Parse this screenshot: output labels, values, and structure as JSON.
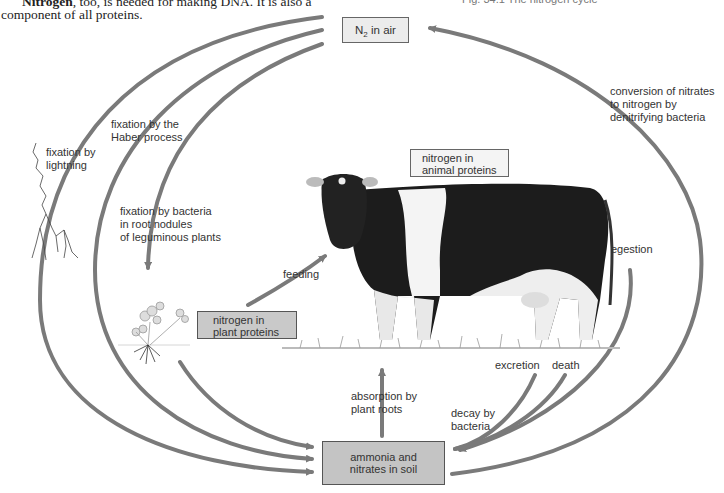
{
  "book": {
    "line1_bold": "Nitrogen",
    "line1_rest": ", too, is needed for making DNA. It is also a",
    "line2": "component of all proteins.",
    "figure_caption": "Fig. 34.1   The nitrogen cycle"
  },
  "diagram": {
    "title": "The nitrogen cycle",
    "boxes": {
      "air": {
        "main": "N",
        "sub": "2",
        "rest": " in air"
      },
      "animal": {
        "line1": "nitrogen in",
        "line2": "animal proteins"
      },
      "plant": {
        "line1": "nitrogen in",
        "line2": "plant proteins"
      },
      "soil": {
        "line1": "ammonia and",
        "line2": "nitrates in soil"
      }
    },
    "labels": {
      "lightning": {
        "line1": "fixation by",
        "line2": "lightning"
      },
      "haber": {
        "line1": "fixation by the",
        "line2": "Haber process"
      },
      "bacteria": {
        "line1": "fixation by bacteria",
        "line2": "in root nodules",
        "line3": "of leguminous plants"
      },
      "denitrify": {
        "line1": "conversion of nitrates",
        "line2": "to nitrogen by",
        "line3": "denitrifying bacteria"
      },
      "feeding": "feeding",
      "egestion": "egestion",
      "excretion": "excretion",
      "death": "death",
      "decay": {
        "line1": "decay by",
        "line2": "bacteria"
      },
      "absorption": {
        "line1": "absorption by",
        "line2": "plant roots"
      }
    },
    "illustrations": [
      "lightning-bolt",
      "clover-plant",
      "holstein-cow",
      "grass"
    ],
    "colors": {
      "arrow": "#7a7a7a",
      "box_dark": "#c4c4c4",
      "box_light": "#ececec"
    }
  }
}
